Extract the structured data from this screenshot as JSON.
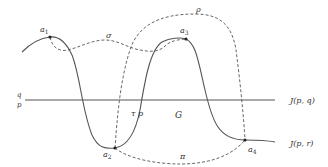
{
  "diagram": {
    "points": {
      "a1": {
        "label": "a",
        "sub": "1"
      },
      "a2": {
        "label": "a",
        "sub": "2"
      },
      "a3": {
        "label": "a",
        "sub": "3"
      },
      "a4": {
        "label": "a",
        "sub": "4"
      }
    },
    "paths": {
      "sigma": "σ",
      "rho": "ρ",
      "pi": "π",
      "tau": "τ"
    },
    "labels": {
      "p_mid": "p",
      "G": "G",
      "frac_num": "q",
      "frac_den": "p",
      "J_pq": "J(p, q)",
      "J_pr": "J(p, r)"
    }
  }
}
